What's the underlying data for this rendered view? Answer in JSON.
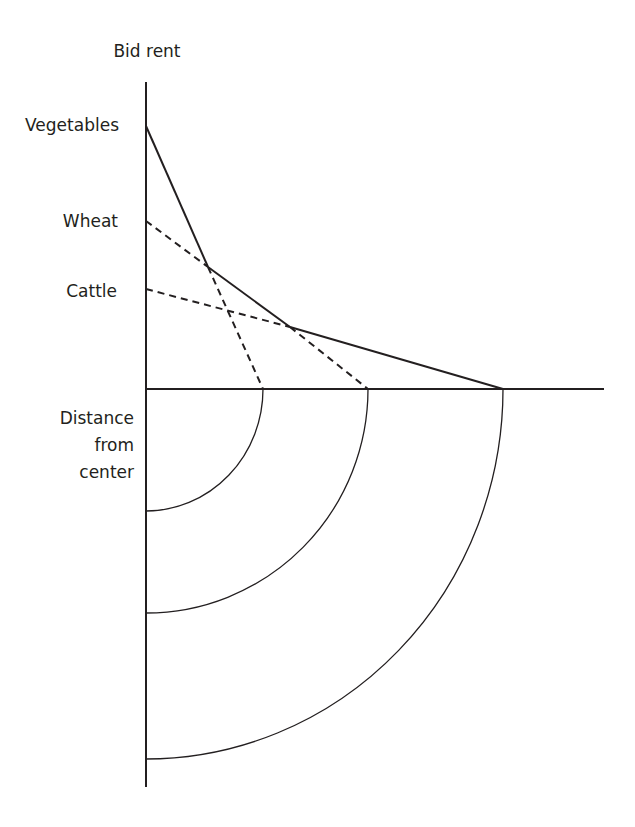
{
  "diagram": {
    "type": "bid-rent-von-thunen",
    "y_axis_label": "Bid rent",
    "x_axis_label_lines": [
      "Distance",
      "from",
      "center"
    ],
    "curves": [
      {
        "name": "Vegetables",
        "label": "Vegetables",
        "style": "solid-then-dashed",
        "intercept_y": 126,
        "zero_x": 263
      },
      {
        "name": "Wheat",
        "label": "Wheat",
        "style": "dashed-then-solid",
        "intercept_y": 221,
        "zero_x": 368
      },
      {
        "name": "Cattle",
        "label": "Cattle",
        "style": "dashed-then-solid",
        "intercept_y": 289,
        "zero_x": 503
      }
    ],
    "rings": [
      {
        "zone": "Vegetables",
        "radius": 117
      },
      {
        "zone": "Wheat",
        "radius": 222
      },
      {
        "zone": "Cattle",
        "radius": 357
      }
    ],
    "colors": {
      "line": "#231f20",
      "background": "#ffffff"
    }
  }
}
